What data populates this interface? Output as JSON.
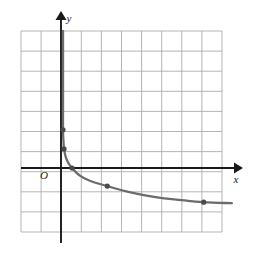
{
  "figure": {
    "kind": "coordinate-plane-graph",
    "background_color": "#ffffff",
    "grid_color": "#a8a8a8",
    "axis_color": "#1a1a1a",
    "curve_color": "#6b6b6b",
    "marker_color": "#4a4a4a",
    "label_color": "#1a1a1a"
  },
  "labels": {
    "origin": "O",
    "x_axis": "x",
    "y_axis": "y"
  },
  "chart_data": {
    "type": "line",
    "title": "",
    "subtitle": "",
    "xlabel": "x",
    "ylabel": "y",
    "grid": true,
    "legend": false,
    "legend_position": "none",
    "xlim": [
      -2,
      8
    ],
    "ylim": [
      -3,
      7
    ],
    "x_tick_labels": [],
    "y_tick_labels": [],
    "grid_step_x": 1,
    "grid_step_y": 1,
    "annotations": [
      "O",
      "x",
      "y"
    ],
    "series": [
      {
        "name": "decreasing-curve",
        "description": "Decreasing curve with vertical asymptote just right of the y-axis, flattening toward a horizontal asymptote below the x-axis.",
        "marked_points": [
          {
            "x": 0.1,
            "y": 1.9
          },
          {
            "x": 0.15,
            "y": 0.95
          },
          {
            "x": 0.55,
            "y": 0.0
          },
          {
            "x": 2.3,
            "y": -0.9
          },
          {
            "x": 7.1,
            "y": -1.7
          }
        ],
        "path_points": [
          {
            "x": 0.1,
            "y": 7.0
          },
          {
            "x": 0.1,
            "y": 5.0
          },
          {
            "x": 0.1,
            "y": 3.0
          },
          {
            "x": 0.1,
            "y": 1.9
          },
          {
            "x": 0.12,
            "y": 1.4
          },
          {
            "x": 0.15,
            "y": 0.95
          },
          {
            "x": 0.25,
            "y": 0.5
          },
          {
            "x": 0.4,
            "y": 0.2
          },
          {
            "x": 0.55,
            "y": 0.0
          },
          {
            "x": 0.9,
            "y": -0.35
          },
          {
            "x": 1.4,
            "y": -0.62
          },
          {
            "x": 2.3,
            "y": -0.9
          },
          {
            "x": 3.4,
            "y": -1.2
          },
          {
            "x": 4.7,
            "y": -1.45
          },
          {
            "x": 6.0,
            "y": -1.6
          },
          {
            "x": 7.1,
            "y": -1.7
          },
          {
            "x": 8.5,
            "y": -1.75
          }
        ]
      }
    ]
  },
  "geometry": {
    "grid_left": 21,
    "grid_top": 31,
    "grid_right": 222,
    "grid_bottom": 232,
    "cell": 20.1,
    "origin_x": 61,
    "origin_y": 168,
    "y_axis_top": 13,
    "y_axis_bottom": 243,
    "x_axis_left": 21,
    "x_axis_right": 241,
    "curve_end_x": 232,
    "marker_radius": 2.6
  }
}
